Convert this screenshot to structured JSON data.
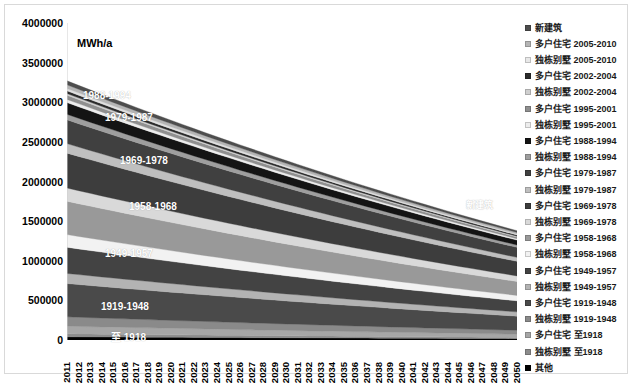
{
  "chart_data": {
    "type": "area",
    "stacked": true,
    "title": "",
    "xlabel": "",
    "ylabel": "MWh/a",
    "ylim": [
      0,
      4000000
    ],
    "ytick_step": 500000,
    "ytick_labels": [
      "4000000",
      "3500000",
      "3000000",
      "2500000",
      "2000000",
      "1500000",
      "1000000",
      "500000",
      "0"
    ],
    "grid": false,
    "legend_position": "right",
    "x": [
      2011,
      2012,
      2013,
      2014,
      2015,
      2016,
      2017,
      2018,
      2019,
      2020,
      2021,
      2022,
      2023,
      2024,
      2025,
      2026,
      2027,
      2028,
      2029,
      2030,
      2031,
      2032,
      2033,
      2034,
      2035,
      2036,
      2037,
      2038,
      2039,
      2040,
      2041,
      2042,
      2043,
      2044,
      2045,
      2046,
      2047,
      2048,
      2049,
      2050
    ],
    "stack_order_bottom_to_top": [
      "其他",
      "独栋别墅 至1918",
      "多户住宅 至1918",
      "独栋别墅 1919-1948",
      "多户住宅 1919-1948",
      "独栋别墅 1949-1957",
      "多户住宅 1949-1957",
      "独栋别墅 1958-1968",
      "多户住宅 1958-1968",
      "独栋别墅 1969-1978",
      "多户住宅 1969-1978",
      "独栋别墅 1979-1987",
      "多户住宅 1979-1987",
      "独栋别墅 1988-1994",
      "多户住宅 1988-1994",
      "独栋别墅 1995-2001",
      "多户住宅 1995-2001",
      "独栋别墅 2002-2004",
      "多户住宅 2002-2004",
      "独栋别墅 2005-2010",
      "多户住宅 2005-2010",
      "新建筑"
    ],
    "series": [
      {
        "name": "其他",
        "color": "#000000",
        "start": 40000,
        "end": 17000
      },
      {
        "name": "独栋别墅 至1918",
        "color": "#8c8c8c",
        "start": 38000,
        "end": 16000
      },
      {
        "name": "多户住宅 至1918",
        "color": "#a6a6a6",
        "start": 96000,
        "end": 40000
      },
      {
        "name": "独栋别墅 1919-1948",
        "color": "#8a8a8a",
        "start": 118000,
        "end": 50000
      },
      {
        "name": "多户住宅 1919-1948",
        "color": "#4a4a4a",
        "start": 420000,
        "end": 178000
      },
      {
        "name": "独栋别墅 1949-1957",
        "color": "#b3b3b3",
        "start": 128000,
        "end": 54000
      },
      {
        "name": "多户住宅 1949-1957",
        "color": "#434343",
        "start": 330000,
        "end": 140000
      },
      {
        "name": "独栋别墅 1958-1968",
        "color": "#f2f2f2",
        "start": 160000,
        "end": 68000
      },
      {
        "name": "多户住宅 1958-1968",
        "color": "#999999",
        "start": 420000,
        "end": 176000
      },
      {
        "name": "独栋别墅 1969-1978",
        "color": "#d9d9d9",
        "start": 168000,
        "end": 70000
      },
      {
        "name": "多户住宅 1969-1978",
        "color": "#3d3d3d",
        "start": 440000,
        "end": 184000
      },
      {
        "name": "独栋别墅 1979-1987",
        "color": "#bfbfbf",
        "start": 120000,
        "end": 50000
      },
      {
        "name": "多户住宅 1979-1987",
        "color": "#404040",
        "start": 300000,
        "end": 126000
      },
      {
        "name": "独栋别墅 1988-1994",
        "color": "#9e9e9e",
        "start": 70000,
        "end": 30000
      },
      {
        "name": "多户住宅 1988-1994",
        "color": "#141414",
        "start": 148000,
        "end": 62000
      },
      {
        "name": "独栋别墅 1995-2001",
        "color": "#ededed",
        "start": 40000,
        "end": 17000
      },
      {
        "name": "多户住宅 1995-2001",
        "color": "#8f8f8f",
        "start": 52000,
        "end": 22000
      },
      {
        "name": "独栋别墅 2002-2004",
        "color": "#cfcfcf",
        "start": 22000,
        "end": 10000
      },
      {
        "name": "多户住宅 2002-2004",
        "color": "#2b2b2b",
        "start": 34000,
        "end": 15000
      },
      {
        "name": "独栋别墅 2005-2010",
        "color": "#e0e0e0",
        "start": 30000,
        "end": 13000
      },
      {
        "name": "多户住宅 2005-2010",
        "color": "#b5b5b5",
        "start": 46000,
        "end": 20000
      },
      {
        "name": "新建筑",
        "color": "#4d4d4d",
        "start": 50000,
        "end": 21000
      }
    ],
    "totals": {
      "2011": 3590000,
      "2050": 1520000
    },
    "annotations": [
      {
        "label": "1988-1994",
        "x": 78,
        "y": 85
      },
      {
        "label": "1979-1987",
        "x": 100,
        "y": 107
      },
      {
        "label": "1969-1978",
        "x": 115,
        "y": 150
      },
      {
        "label": "1958-1968",
        "x": 124,
        "y": 196
      },
      {
        "label": "1949-1957",
        "x": 100,
        "y": 243
      },
      {
        "label": "1919-1948",
        "x": 96,
        "y": 296
      },
      {
        "label": "至 1918",
        "x": 106,
        "y": 324
      },
      {
        "label": "新建筑",
        "x": 461,
        "y": 193
      }
    ]
  },
  "legend": {
    "items": [
      {
        "label": "新建筑",
        "color": "#4d4d4d"
      },
      {
        "label": "多户住宅 2005-2010",
        "color": "#b5b5b5"
      },
      {
        "label": "独栋别墅 2005-2010",
        "color": "#e8e8e8"
      },
      {
        "label": "多户住宅 2002-2004",
        "color": "#2b2b2b"
      },
      {
        "label": "独栋别墅 2002-2004",
        "color": "#cfcfcf"
      },
      {
        "label": "多户住宅 1995-2001",
        "color": "#8f8f8f"
      },
      {
        "label": "独栋别墅 1995-2001",
        "color": "#ededed"
      },
      {
        "label": "多户住宅 1988-1994",
        "color": "#141414"
      },
      {
        "label": "独栋别墅 1988-1994",
        "color": "#9e9e9e"
      },
      {
        "label": "多户住宅 1979-1987",
        "color": "#404040"
      },
      {
        "label": "独栋别墅 1979-1987",
        "color": "#bfbfbf"
      },
      {
        "label": "多户住宅 1969-1978",
        "color": "#3d3d3d"
      },
      {
        "label": "独栋别墅 1969-1978",
        "color": "#d9d9d9"
      },
      {
        "label": "多户住宅 1958-1968",
        "color": "#999999"
      },
      {
        "label": "独栋别墅 1958-1968",
        "color": "#f2f2f2"
      },
      {
        "label": "多户住宅 1949-1957",
        "color": "#434343"
      },
      {
        "label": "独栋别墅 1949-1957",
        "color": "#b3b3b3"
      },
      {
        "label": "多户住宅 1919-1948",
        "color": "#4a4a4a"
      },
      {
        "label": "独栋别墅 1919-1948",
        "color": "#8a8a8a"
      },
      {
        "label": "多户住宅 至1918",
        "color": "#a6a6a6"
      },
      {
        "label": "独栋别墅 至1918",
        "color": "#8c8c8c"
      },
      {
        "label": "其他",
        "color": "#000000"
      }
    ]
  }
}
